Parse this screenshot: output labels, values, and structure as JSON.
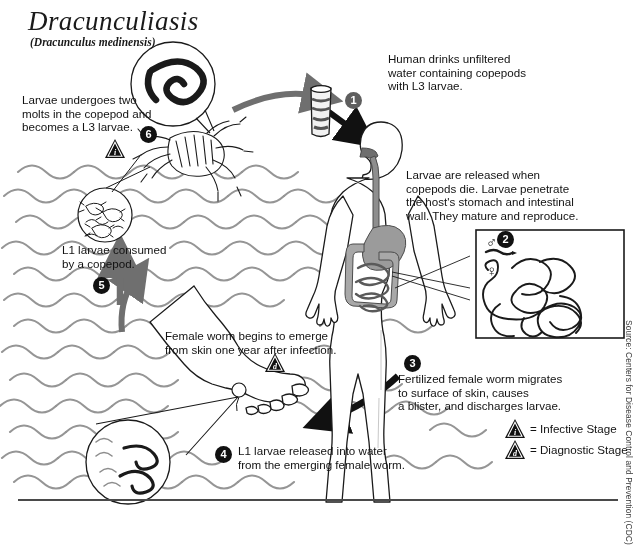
{
  "title": "Dracunculiasis",
  "subtitle": "(Dracunculus medinensis)",
  "source": "Source: Centers for Disease Control and Prevention (CDC)",
  "steps": [
    {
      "num": "1",
      "badge_color": "#5e5e5e",
      "text": "Human drinks unfiltered\nwater containing copepods\nwith L3 larvae."
    },
    {
      "num": "2",
      "badge_color": "#111111",
      "text": "Larvae are released when\ncopepods die.  Larvae penetrate\nthe host's stomach and intestinal\nwall.  They mature and reproduce."
    },
    {
      "num": "3",
      "badge_color": "#111111",
      "text": "Fertilized female worm migrates\nto surface of skin, causes\na blister, and discharges larvae."
    },
    {
      "num": "4",
      "badge_color": "#111111",
      "text": "L1 larvae released into water\nfrom the emerging female worm."
    },
    {
      "num": "5",
      "badge_color": "#111111",
      "text": "L1 larvae consumed\nby a copepod."
    },
    {
      "num": "6",
      "badge_color": "#111111",
      "text": "Larvae undergoes two\nmolts in the copepod and\nbecomes a L3 larvae."
    }
  ],
  "female_emerge_note": "Female worm begins to emerge\nfrom skin one year after infection.",
  "inset": {
    "male_symbol": "♂",
    "female_symbol": "♀"
  },
  "legend": {
    "infective": {
      "marker": "i",
      "label": "= Infective Stage"
    },
    "diagnostic": {
      "marker": "d",
      "label": "= Diagnostic Stage"
    }
  },
  "markers": {
    "infective_stage_marker": "i",
    "diagnostic_stage_marker": "d"
  },
  "colors": {
    "arrow_gray": "#6f6f6f",
    "arrow_black": "#111111",
    "wave_gray": "#8d8d8d",
    "organ_gray": "#9b9b9b",
    "outline": "#1a1a1a"
  }
}
